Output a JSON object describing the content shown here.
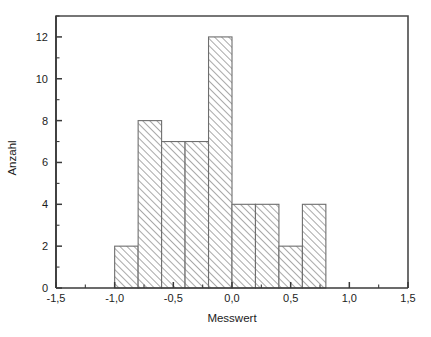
{
  "chart_data": {
    "type": "bar",
    "title": "",
    "subtitle": "",
    "xlabel": "Messwert",
    "ylabel": "Anzahl",
    "xlim": [
      -1.5,
      1.5
    ],
    "ylim": [
      0,
      13
    ],
    "grid": false,
    "legend": null,
    "bin_width": 0.2,
    "bin_edges": [
      -1.0,
      -0.8,
      -0.6,
      -0.4,
      -0.2,
      0.0,
      0.2,
      0.4,
      0.6,
      0.8
    ],
    "categories": [
      "-1,0 – -0,8",
      "-0,8 – -0,6",
      "-0,6 – -0,4",
      "-0,4 – -0,2",
      "-0,2 – 0,0",
      "0,0 – 0,2",
      "0,2 – 0,4",
      "0,4 – 0,6",
      "0,6 – 0,8"
    ],
    "values": [
      2,
      8,
      7,
      7,
      12,
      4,
      4,
      2,
      4
    ],
    "total_count": 50,
    "x_tick_labels": [
      "-1,5",
      "-1,0",
      "-0,5",
      "0,0",
      "0,5",
      "1,0",
      "1,5"
    ],
    "x_tick_values": [
      -1.5,
      -1.0,
      -0.5,
      0.0,
      0.5,
      1.0,
      1.5
    ],
    "x_minor_tick_values": [
      -1.25,
      -0.75,
      -0.25,
      0.25,
      0.75,
      1.25
    ],
    "y_tick_labels": [
      "0",
      "2",
      "4",
      "6",
      "8",
      "10",
      "12"
    ],
    "y_tick_values": [
      0,
      2,
      4,
      6,
      8,
      10,
      12
    ],
    "y_minor_tick_values": [
      1,
      3,
      5,
      7,
      9,
      11,
      13
    ],
    "colors": {
      "background": "#ffffff",
      "bar_edge": "#6e6e6e",
      "bar_hatch": "#9a9a9a",
      "bar_fill": "#ffffff",
      "axis": "#3a3a3a",
      "frame": "#4a4a4a",
      "text": "#1c1c1c"
    }
  }
}
